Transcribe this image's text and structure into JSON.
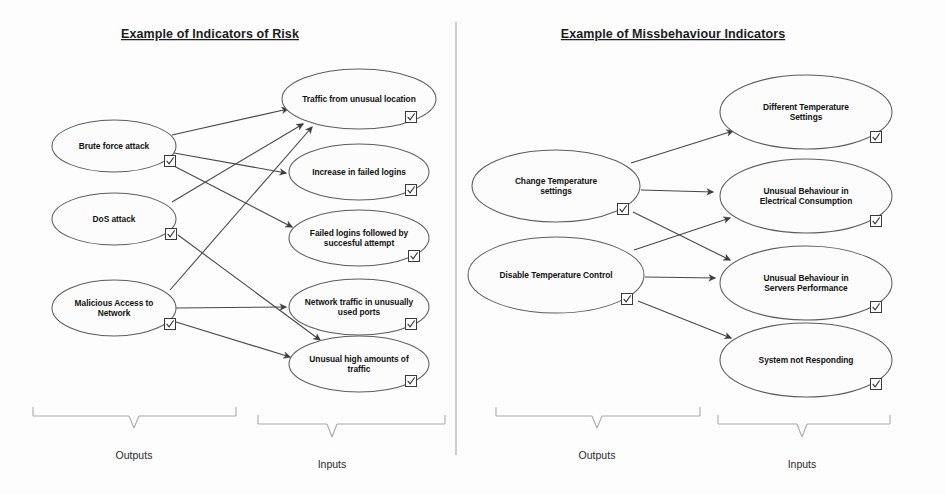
{
  "figure": {
    "background_color": "#fdfdfd",
    "node_fill": "#fcfcfc",
    "node_stroke": "#5d5d5d",
    "edge_color": "#474747",
    "title_color": "#1c1c1c"
  },
  "panels": [
    {
      "id": "risk",
      "title": "Example of Indicators of Risk",
      "title_x": 210,
      "title_y": 38,
      "outputs_label": "Outputs",
      "inputs_label": "Inputs",
      "outputs_label_x": 134,
      "outputs_label_y": 459,
      "inputs_label_x": 332,
      "inputs_label_y": 468,
      "outputs_brace": {
        "x1": 33,
        "x2": 236,
        "y": 407,
        "stem_y": 428,
        "mid": 134
      },
      "inputs_brace": {
        "x1": 258,
        "x2": 445,
        "y": 415,
        "stem_y": 437,
        "mid": 332
      },
      "outputs": [
        {
          "id": "brute",
          "label": "Brute force attack",
          "lines": [
            "Brute force attack"
          ],
          "cx": 114,
          "cy": 146,
          "rx": 62,
          "ry": 26,
          "check_x": 170,
          "check_y": 161
        },
        {
          "id": "dos",
          "label": "DoS attack",
          "lines": [
            "DoS attack"
          ],
          "cx": 114,
          "cy": 219,
          "rx": 62,
          "ry": 26,
          "check_x": 171,
          "check_y": 234
        },
        {
          "id": "malicious",
          "label": "Malicious Access to Network",
          "lines": [
            "Malicious Access to",
            "Network"
          ],
          "cx": 114,
          "cy": 308,
          "rx": 62,
          "ry": 28,
          "check_x": 170,
          "check_y": 324
        }
      ],
      "inputs": [
        {
          "id": "traffic-unusual-loc",
          "label": "Traffic from unusual location",
          "lines": [
            "Traffic from unusual location"
          ],
          "cx": 359,
          "cy": 99,
          "rx": 77,
          "ry": 30,
          "check_x": 411,
          "check_y": 117
        },
        {
          "id": "increase-failed-logins",
          "label": "Increase in failed logins",
          "lines": [
            "Increase in failed logins"
          ],
          "cx": 359,
          "cy": 172,
          "rx": 70,
          "ry": 28,
          "check_x": 411,
          "check_y": 190
        },
        {
          "id": "failed-then-success",
          "label": "Failed logins followed by succesful attempt",
          "lines": [
            "Failed logins followed by",
            "succesful attempt"
          ],
          "cx": 359,
          "cy": 238,
          "rx": 70,
          "ry": 28,
          "check_x": 414,
          "check_y": 256
        },
        {
          "id": "network-traffic-ports",
          "label": "Network traffic in unusually used ports",
          "lines": [
            "Network traffic in unusually",
            "used ports"
          ],
          "cx": 359,
          "cy": 307,
          "rx": 70,
          "ry": 28,
          "check_x": 411,
          "check_y": 324
        },
        {
          "id": "unusual-high-traffic",
          "label": "Unusual high amounts of traffic",
          "lines": [
            "Unusual high amounts of",
            "traffic"
          ],
          "cx": 359,
          "cy": 364,
          "rx": 70,
          "ry": 28,
          "check_x": 411,
          "check_y": 381
        }
      ],
      "edges": [
        {
          "from": "brute",
          "to": "traffic-unusual-loc",
          "x1": 172,
          "y1": 135,
          "x2": 288,
          "y2": 109
        },
        {
          "from": "brute",
          "to": "increase-failed-logins",
          "x1": 174,
          "y1": 153,
          "x2": 286,
          "y2": 173
        },
        {
          "from": "brute",
          "to": "failed-then-success",
          "x1": 172,
          "y1": 165,
          "x2": 292,
          "y2": 227
        },
        {
          "from": "dos",
          "to": "traffic-unusual-loc",
          "x1": 172,
          "y1": 202,
          "x2": 303,
          "y2": 124
        },
        {
          "from": "malicious",
          "to": "traffic-unusual-loc",
          "x1": 170,
          "y1": 290,
          "x2": 312,
          "y2": 127
        },
        {
          "from": "malicious",
          "to": "network-traffic-ports",
          "x1": 176,
          "y1": 308,
          "x2": 286,
          "y2": 307
        },
        {
          "from": "malicious",
          "to": "unusual-high-traffic",
          "x1": 176,
          "y1": 322,
          "x2": 290,
          "y2": 357
        },
        {
          "from": "dos",
          "to": "unusual-high-traffic",
          "x1": 178,
          "y1": 235,
          "x2": 320,
          "y2": 340
        }
      ]
    },
    {
      "id": "misbehaviour",
      "title": "Example of Missbehaviour Indicators",
      "title_x": 673,
      "title_y": 38,
      "outputs_label": "Outputs",
      "inputs_label": "Inputs",
      "outputs_label_x": 597,
      "outputs_label_y": 459,
      "inputs_label_x": 802,
      "inputs_label_y": 468,
      "outputs_brace": {
        "x1": 496,
        "x2": 700,
        "y": 407,
        "stem_y": 428,
        "mid": 597
      },
      "inputs_brace": {
        "x1": 718,
        "x2": 890,
        "y": 415,
        "stem_y": 437,
        "mid": 802
      },
      "outputs": [
        {
          "id": "change-temp",
          "label": "Change Temperature settings",
          "lines": [
            "Change Temperature",
            "settings"
          ],
          "cx": 556,
          "cy": 186,
          "rx": 84,
          "ry": 36,
          "check_x": 623,
          "check_y": 209
        },
        {
          "id": "disable-temp",
          "label": "Disable Temperature Control",
          "lines": [
            "Disable Temperature Control"
          ],
          "cx": 556,
          "cy": 275,
          "rx": 88,
          "ry": 38,
          "check_x": 627,
          "check_y": 299
        },
        {
          "id": "disable-temp-extra",
          "label": "",
          "lines": [],
          "cx": 0,
          "cy": 0,
          "rx": 0,
          "ry": 0,
          "check_x": 0,
          "check_y": 0
        }
      ],
      "inputs": [
        {
          "id": "different-temp-settings",
          "label": "Different Temperature Settings",
          "lines": [
            "Different Temperature",
            "Settings"
          ],
          "cx": 806,
          "cy": 112,
          "rx": 86,
          "ry": 37,
          "check_x": 876,
          "check_y": 137
        },
        {
          "id": "unusual-electrical",
          "label": "Unusual Behaviour in Electrical Consumption",
          "lines": [
            "Unusual Behaviour in",
            "Electrical Consumption"
          ],
          "cx": 806,
          "cy": 196,
          "rx": 86,
          "ry": 37,
          "check_x": 876,
          "check_y": 221
        },
        {
          "id": "unusual-servers",
          "label": "Unusual Behaviour in Servers Performance",
          "lines": [
            "Unusual Behaviour in",
            "Servers Performance"
          ],
          "cx": 806,
          "cy": 283,
          "rx": 86,
          "ry": 37,
          "check_x": 876,
          "check_y": 307
        },
        {
          "id": "system-not-responding",
          "label": "System not Responding",
          "lines": [
            "System not Responding"
          ],
          "cx": 806,
          "cy": 360,
          "rx": 86,
          "ry": 37,
          "check_x": 876,
          "check_y": 384
        }
      ],
      "edges": [
        {
          "from": "change-temp",
          "to": "different-temp-settings",
          "x1": 631,
          "y1": 163,
          "x2": 733,
          "y2": 131
        },
        {
          "from": "change-temp",
          "to": "unusual-electrical",
          "x1": 641,
          "y1": 190,
          "x2": 713,
          "y2": 192
        },
        {
          "from": "change-temp",
          "to": "unusual-servers",
          "x1": 633,
          "y1": 212,
          "x2": 730,
          "y2": 260
        },
        {
          "from": "disable-temp",
          "to": "unusual-electrical",
          "x1": 634,
          "y1": 250,
          "x2": 730,
          "y2": 218
        },
        {
          "from": "disable-temp",
          "to": "unusual-servers",
          "x1": 645,
          "y1": 277,
          "x2": 715,
          "y2": 278
        },
        {
          "from": "disable-temp",
          "to": "system-not-responding",
          "x1": 638,
          "y1": 301,
          "x2": 731,
          "y2": 338
        }
      ]
    }
  ],
  "divider": {
    "x": 456,
    "y1": 22,
    "y2": 455
  }
}
